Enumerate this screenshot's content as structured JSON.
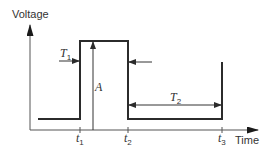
{
  "diagram": {
    "axes": {
      "y_label": "Voltage",
      "x_label": "Time"
    },
    "time_marks": [
      {
        "name": "t",
        "sub": "1"
      },
      {
        "name": "t",
        "sub": "2"
      },
      {
        "name": "t",
        "sub": "3"
      }
    ],
    "annotations": {
      "amplitude": "A",
      "t1_label": {
        "name": "T",
        "sub": "1"
      },
      "t2_label": {
        "name": "T",
        "sub": "2"
      }
    },
    "colors": {
      "stroke": "#2b2b2b",
      "axis": "#555555"
    }
  }
}
